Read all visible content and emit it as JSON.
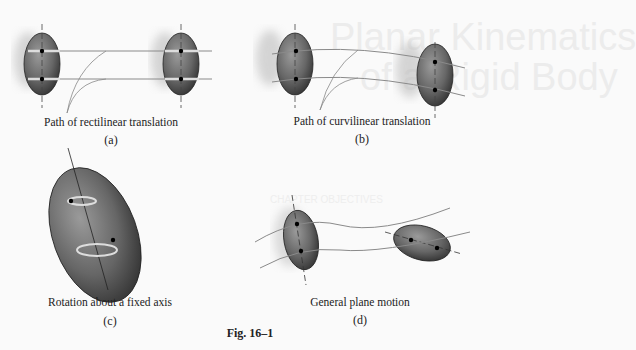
{
  "figure": {
    "number": "Fig. 16–1",
    "panels": [
      {
        "id": "a",
        "caption": "Path of rectilinear translation",
        "label": "(a)"
      },
      {
        "id": "b",
        "caption": "Path of curvilinear translation",
        "label": "(b)"
      },
      {
        "id": "c",
        "caption": "Rotation about a fixed axis",
        "label": "(c)"
      },
      {
        "id": "d",
        "caption": "General plane motion",
        "label": "(d)"
      }
    ]
  },
  "background_showthrough": {
    "title_line1": "Planar Kinematics",
    "title_line2": "of a Rigid Body",
    "section": "CHAPTER OBJECTIVES"
  },
  "colors": {
    "body_fill": "#6e6e6e",
    "body_dark": "#3a3a3a",
    "path_line": "#8a8a8a",
    "highlight": "#d8d8d8",
    "text": "#222222"
  }
}
